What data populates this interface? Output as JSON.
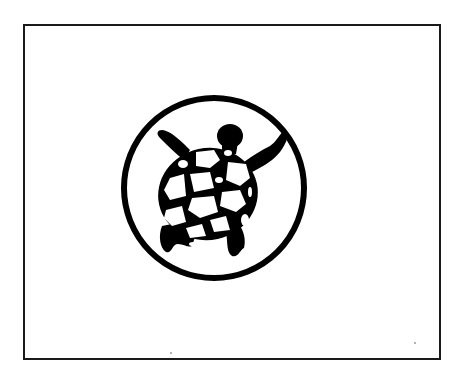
{
  "figure": {
    "kind": "flag-illustration",
    "colors": {
      "background": "#ffffff",
      "ink": "#000000",
      "border": "#1a1a1a"
    },
    "emblem": {
      "icon": "turtle-icon",
      "enclosure": "circle"
    }
  }
}
